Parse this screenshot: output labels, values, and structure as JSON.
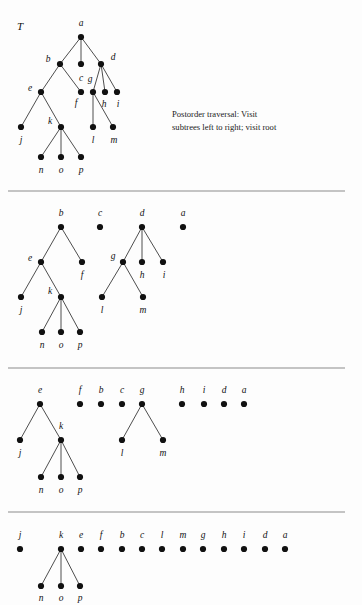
{
  "figure": {
    "title_label": "T",
    "note": "Postorder traversal:  Visit\nsubtrees left to right; visit root",
    "colors": {
      "node": "#111111",
      "edge": "#3a3a3a",
      "divider": "#8c8c8c",
      "background": "#fdfdfd",
      "text": "#111111"
    }
  },
  "chart_data": {
    "type": "diagram",
    "panels": [
      {
        "index": 1,
        "caption": "T",
        "divider_y": 191,
        "nodes": [
          {
            "id": "a",
            "x": 81,
            "y": 37,
            "label": "a",
            "lx": 81,
            "ly": 24
          },
          {
            "id": "b",
            "x": 60,
            "y": 64,
            "label": "b",
            "lx": 48,
            "ly": 60
          },
          {
            "id": "c",
            "x": 81,
            "y": 64,
            "label": "c",
            "lx": 81,
            "ly": 79
          },
          {
            "id": "d",
            "x": 101,
            "y": 64,
            "label": "d",
            "lx": 113,
            "ly": 58
          },
          {
            "id": "e",
            "x": 41,
            "y": 92,
            "label": "e",
            "lx": 30,
            "ly": 89
          },
          {
            "id": "f",
            "x": 81,
            "y": 92,
            "label": "f",
            "lx": 76,
            "ly": 104
          },
          {
            "id": "g",
            "x": 93,
            "y": 92,
            "label": "g",
            "lx": 90,
            "ly": 80
          },
          {
            "id": "h",
            "x": 105,
            "y": 92,
            "label": "h",
            "lx": 104,
            "ly": 105
          },
          {
            "id": "i",
            "x": 117,
            "y": 92,
            "label": "i",
            "lx": 118,
            "ly": 105
          },
          {
            "id": "j",
            "x": 21,
            "y": 127,
            "label": "j",
            "lx": 21,
            "ly": 141
          },
          {
            "id": "k",
            "x": 61,
            "y": 127,
            "label": "k",
            "lx": 50,
            "ly": 122
          },
          {
            "id": "l",
            "x": 93,
            "y": 127,
            "label": "l",
            "lx": 93,
            "ly": 141
          },
          {
            "id": "m",
            "x": 113,
            "y": 127,
            "label": "m",
            "lx": 114,
            "ly": 141
          },
          {
            "id": "n",
            "x": 41,
            "y": 157,
            "label": "n",
            "lx": 41,
            "ly": 171
          },
          {
            "id": "o",
            "x": 61,
            "y": 157,
            "label": "o",
            "lx": 61,
            "ly": 171
          },
          {
            "id": "p",
            "x": 81,
            "y": 157,
            "label": "p",
            "lx": 81,
            "ly": 171
          }
        ],
        "edges": [
          [
            "a",
            "b"
          ],
          [
            "a",
            "c"
          ],
          [
            "a",
            "d"
          ],
          [
            "b",
            "e"
          ],
          [
            "b",
            "f"
          ],
          [
            "d",
            "g"
          ],
          [
            "d",
            "h"
          ],
          [
            "d",
            "i"
          ],
          [
            "e",
            "j"
          ],
          [
            "e",
            "k"
          ],
          [
            "g",
            "l"
          ],
          [
            "g",
            "m"
          ],
          [
            "k",
            "n"
          ],
          [
            "k",
            "o"
          ],
          [
            "k",
            "p"
          ]
        ]
      },
      {
        "index": 2,
        "caption": "",
        "divider_y": 368,
        "nodes": [
          {
            "id": "b",
            "x": 61,
            "y": 227,
            "label": "b",
            "lx": 61,
            "ly": 214
          },
          {
            "id": "c",
            "x": 100,
            "y": 227,
            "label": "c",
            "lx": 100,
            "ly": 214
          },
          {
            "id": "d",
            "x": 142,
            "y": 227,
            "label": "d",
            "lx": 142,
            "ly": 214
          },
          {
            "id": "a",
            "x": 183,
            "y": 227,
            "label": "a",
            "lx": 183,
            "ly": 214
          },
          {
            "id": "e",
            "x": 41,
            "y": 262,
            "label": "e",
            "lx": 30,
            "ly": 259
          },
          {
            "id": "f",
            "x": 82,
            "y": 262,
            "label": "f",
            "lx": 82,
            "ly": 276
          },
          {
            "id": "g",
            "x": 123,
            "y": 262,
            "label": "g",
            "lx": 113,
            "ly": 257
          },
          {
            "id": "h",
            "x": 142,
            "y": 262,
            "label": "h",
            "lx": 142,
            "ly": 276
          },
          {
            "id": "i",
            "x": 163,
            "y": 262,
            "label": "i",
            "lx": 164,
            "ly": 276
          },
          {
            "id": "j",
            "x": 21,
            "y": 297,
            "label": "j",
            "lx": 21,
            "ly": 311
          },
          {
            "id": "k",
            "x": 61,
            "y": 297,
            "label": "k",
            "lx": 50,
            "ly": 292
          },
          {
            "id": "l",
            "x": 102,
            "y": 297,
            "label": "l",
            "lx": 102,
            "ly": 311
          },
          {
            "id": "m",
            "x": 143,
            "y": 297,
            "label": "m",
            "lx": 143,
            "ly": 311
          },
          {
            "id": "n",
            "x": 42,
            "y": 332,
            "label": "n",
            "lx": 42,
            "ly": 346
          },
          {
            "id": "o",
            "x": 61,
            "y": 332,
            "label": "o",
            "lx": 61,
            "ly": 346
          },
          {
            "id": "p",
            "x": 80,
            "y": 332,
            "label": "p",
            "lx": 80,
            "ly": 346
          }
        ],
        "edges": [
          [
            "b",
            "e"
          ],
          [
            "b",
            "f"
          ],
          [
            "d",
            "g"
          ],
          [
            "d",
            "h"
          ],
          [
            "d",
            "i"
          ],
          [
            "e",
            "j"
          ],
          [
            "e",
            "k"
          ],
          [
            "g",
            "l"
          ],
          [
            "g",
            "m"
          ],
          [
            "k",
            "n"
          ],
          [
            "k",
            "o"
          ],
          [
            "k",
            "p"
          ]
        ]
      },
      {
        "index": 3,
        "caption": "",
        "divider_y": 512,
        "nodes": [
          {
            "id": "e",
            "x": 40,
            "y": 404,
            "label": "e",
            "lx": 40,
            "ly": 391
          },
          {
            "id": "f",
            "x": 80,
            "y": 404,
            "label": "f",
            "lx": 80,
            "ly": 391
          },
          {
            "id": "b",
            "x": 101,
            "y": 404,
            "label": "b",
            "lx": 101,
            "ly": 391
          },
          {
            "id": "c",
            "x": 122,
            "y": 404,
            "label": "c",
            "lx": 122,
            "ly": 391
          },
          {
            "id": "g",
            "x": 142,
            "y": 404,
            "label": "g",
            "lx": 142,
            "ly": 391
          },
          {
            "id": "h",
            "x": 182,
            "y": 404,
            "label": "h",
            "lx": 182,
            "ly": 391
          },
          {
            "id": "i",
            "x": 204,
            "y": 404,
            "label": "i",
            "lx": 204,
            "ly": 391
          },
          {
            "id": "d",
            "x": 224,
            "y": 404,
            "label": "d",
            "lx": 224,
            "ly": 391
          },
          {
            "id": "a",
            "x": 244,
            "y": 404,
            "label": "a",
            "lx": 244,
            "ly": 391
          },
          {
            "id": "j",
            "x": 20,
            "y": 440,
            "label": "j",
            "lx": 20,
            "ly": 454
          },
          {
            "id": "k",
            "x": 61,
            "y": 440,
            "label": "k",
            "lx": 61,
            "ly": 427
          },
          {
            "id": "l",
            "x": 122,
            "y": 440,
            "label": "l",
            "lx": 122,
            "ly": 454
          },
          {
            "id": "m",
            "x": 163,
            "y": 440,
            "label": "m",
            "lx": 163,
            "ly": 454
          },
          {
            "id": "n",
            "x": 41,
            "y": 477,
            "label": "n",
            "lx": 41,
            "ly": 491
          },
          {
            "id": "o",
            "x": 61,
            "y": 477,
            "label": "o",
            "lx": 61,
            "ly": 491
          },
          {
            "id": "p",
            "x": 80,
            "y": 477,
            "label": "p",
            "lx": 80,
            "ly": 491
          }
        ],
        "edges": [
          [
            "e",
            "j"
          ],
          [
            "e",
            "k"
          ],
          [
            "g",
            "l"
          ],
          [
            "g",
            "m"
          ],
          [
            "k",
            "n"
          ],
          [
            "k",
            "o"
          ],
          [
            "k",
            "p"
          ]
        ]
      },
      {
        "index": 4,
        "caption": "",
        "divider_y": null,
        "nodes": [
          {
            "id": "j",
            "x": 20,
            "y": 549,
            "label": "j",
            "lx": 20,
            "ly": 536
          },
          {
            "id": "k",
            "x": 61,
            "y": 549,
            "label": "k",
            "lx": 61,
            "ly": 536
          },
          {
            "id": "e",
            "x": 81,
            "y": 549,
            "label": "e",
            "lx": 81,
            "ly": 536
          },
          {
            "id": "f",
            "x": 101,
            "y": 549,
            "label": "f",
            "lx": 101,
            "ly": 536
          },
          {
            "id": "b",
            "x": 122,
            "y": 549,
            "label": "b",
            "lx": 122,
            "ly": 536
          },
          {
            "id": "c",
            "x": 142,
            "y": 549,
            "label": "c",
            "lx": 142,
            "ly": 536
          },
          {
            "id": "l",
            "x": 162,
            "y": 549,
            "label": "l",
            "lx": 162,
            "ly": 536
          },
          {
            "id": "m",
            "x": 183,
            "y": 549,
            "label": "m",
            "lx": 183,
            "ly": 536
          },
          {
            "id": "g",
            "x": 203,
            "y": 549,
            "label": "g",
            "lx": 203,
            "ly": 536
          },
          {
            "id": "h",
            "x": 224,
            "y": 549,
            "label": "h",
            "lx": 224,
            "ly": 536
          },
          {
            "id": "i",
            "x": 244,
            "y": 549,
            "label": "i",
            "lx": 244,
            "ly": 536
          },
          {
            "id": "d",
            "x": 265,
            "y": 549,
            "label": "d",
            "lx": 265,
            "ly": 536
          },
          {
            "id": "a",
            "x": 285,
            "y": 549,
            "label": "a",
            "lx": 285,
            "ly": 536
          },
          {
            "id": "n",
            "x": 41,
            "y": 586,
            "label": "n",
            "lx": 41,
            "ly": 599
          },
          {
            "id": "o",
            "x": 61,
            "y": 586,
            "label": "o",
            "lx": 61,
            "ly": 599
          },
          {
            "id": "p",
            "x": 80,
            "y": 586,
            "label": "p",
            "lx": 80,
            "ly": 599
          }
        ],
        "edges": [
          [
            "k",
            "n"
          ],
          [
            "k",
            "o"
          ],
          [
            "k",
            "p"
          ]
        ]
      }
    ],
    "dividers": [
      {
        "y": 191,
        "x1": 8,
        "x2": 345
      },
      {
        "y": 368,
        "x1": 8,
        "x2": 345
      },
      {
        "y": 512,
        "x1": 8,
        "x2": 345
      }
    ],
    "note_position": {
      "x": 172,
      "y": 108
    },
    "title_position": {
      "x": 20,
      "y": 26
    },
    "node_radius": 3.1,
    "postorder_sequence": [
      "j",
      "n",
      "o",
      "p",
      "k",
      "e",
      "f",
      "b",
      "c",
      "l",
      "m",
      "g",
      "h",
      "i",
      "d",
      "a"
    ]
  }
}
